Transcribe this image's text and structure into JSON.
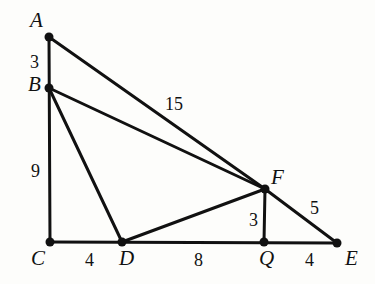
{
  "figure": {
    "stroke_color": "#111111",
    "background_color": "#fdfdfb",
    "points": [
      {
        "id": "A",
        "label": "A",
        "x": 49,
        "y": 37,
        "label_x": 30,
        "label_y": 10
      },
      {
        "id": "B",
        "label": "B",
        "x": 49,
        "y": 88,
        "label_x": 28,
        "label_y": 74
      },
      {
        "id": "C",
        "label": "C",
        "x": 50,
        "y": 242,
        "label_x": 31,
        "label_y": 248
      },
      {
        "id": "D",
        "label": "D",
        "x": 122,
        "y": 242,
        "label_x": 119,
        "label_y": 248
      },
      {
        "id": "Q",
        "label": "Q",
        "x": 264,
        "y": 242,
        "label_x": 259,
        "label_y": 248
      },
      {
        "id": "E",
        "label": "E",
        "x": 337,
        "y": 243,
        "label_x": 345,
        "label_y": 248
      },
      {
        "id": "F",
        "label": "F",
        "x": 265,
        "y": 189,
        "label_x": 271,
        "label_y": 167
      }
    ],
    "segments": [
      {
        "name": "segment-A-C",
        "from": "A",
        "to": "C"
      },
      {
        "name": "segment-A-F",
        "from": "A",
        "to": "F"
      },
      {
        "name": "segment-B-F",
        "from": "B",
        "to": "F"
      },
      {
        "name": "segment-B-D",
        "from": "B",
        "to": "D"
      },
      {
        "name": "segment-C-E",
        "from": "C",
        "to": "E"
      },
      {
        "name": "segment-D-F",
        "from": "D",
        "to": "F"
      },
      {
        "name": "segment-F-Q",
        "from": "F",
        "to": "Q"
      },
      {
        "name": "segment-F-E",
        "from": "F",
        "to": "E"
      }
    ],
    "measurements": [
      {
        "name": "length-AB",
        "value": "3",
        "x": 30,
        "y": 53,
        "for": "segment A to B"
      },
      {
        "name": "length-BC",
        "value": "9",
        "x": 31,
        "y": 162,
        "for": "segment B to C"
      },
      {
        "name": "length-AF",
        "value": "15",
        "x": 165,
        "y": 95,
        "for": "segment A to F"
      },
      {
        "name": "length-FE",
        "value": "5",
        "x": 310,
        "y": 199,
        "for": "segment F to E"
      },
      {
        "name": "length-FQ",
        "value": "3",
        "x": 249,
        "y": 211,
        "for": "segment F to Q"
      },
      {
        "name": "length-CD",
        "value": "4",
        "x": 85,
        "y": 251,
        "for": "segment C to D"
      },
      {
        "name": "length-DQ",
        "value": "8",
        "x": 194,
        "y": 251,
        "for": "segment D to Q"
      },
      {
        "name": "length-QE",
        "value": "4",
        "x": 305,
        "y": 251,
        "for": "segment Q to E"
      }
    ]
  }
}
